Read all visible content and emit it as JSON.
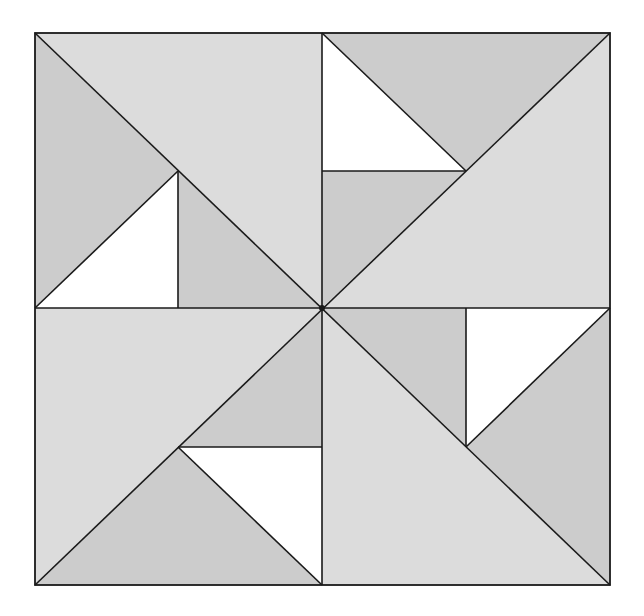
{
  "diagram": {
    "title": "",
    "colors": {
      "light": "#dcdcdc",
      "medium": "#cccccc",
      "white": "#ffffff",
      "stroke": "#1a1a1a",
      "background": "#ffffff"
    },
    "square": {
      "x0": 35,
      "y0": 33,
      "x1": 610,
      "y1": 585,
      "cx": 322,
      "cy": 308
    },
    "quadrants": [
      {
        "name": "top-left",
        "pieces": [
          {
            "id": "tl-large",
            "fill": "light",
            "points": "35,33 610,33 322,308",
            "note": "placeholder overwritten below"
          }
        ]
      }
    ],
    "pieces": [
      {
        "id": "tl-large",
        "quadrant": "top-left",
        "fill": "light",
        "points": "35,33 322,33 322,308"
      },
      {
        "id": "tl-left",
        "quadrant": "top-left",
        "fill": "medium",
        "points": "35,33 178,171 35,308"
      },
      {
        "id": "tl-white",
        "quadrant": "top-left",
        "fill": "white",
        "points": "35,308 178,171 178,308"
      },
      {
        "id": "tl-inner",
        "quadrant": "top-left",
        "fill": "medium",
        "points": "178,171 322,308 178,308"
      },
      {
        "id": "tr-large",
        "quadrant": "top-right",
        "fill": "light",
        "points": "610,33 610,308 322,308"
      },
      {
        "id": "tr-top",
        "quadrant": "top-right",
        "fill": "medium",
        "points": "322,33 610,33 466,171"
      },
      {
        "id": "tr-white",
        "quadrant": "top-right",
        "fill": "white",
        "points": "322,33 466,171 322,171"
      },
      {
        "id": "tr-inner",
        "quadrant": "top-right",
        "fill": "medium",
        "points": "322,171 466,171 322,308"
      },
      {
        "id": "bl-large",
        "quadrant": "bottom-left",
        "fill": "light",
        "points": "35,308 322,308 35,585"
      },
      {
        "id": "bl-inner",
        "quadrant": "bottom-left",
        "fill": "medium",
        "points": "322,308 322,447 178,447"
      },
      {
        "id": "bl-white",
        "quadrant": "bottom-left",
        "fill": "white",
        "points": "178,447 322,447 322,585"
      },
      {
        "id": "bl-bottom",
        "quadrant": "bottom-left",
        "fill": "medium",
        "points": "35,585 178,447 322,585"
      },
      {
        "id": "br-large",
        "quadrant": "bottom-right",
        "fill": "light",
        "points": "322,308 610,585 322,585"
      },
      {
        "id": "br-inner",
        "quadrant": "bottom-right",
        "fill": "medium",
        "points": "322,308 466,308 466,447"
      },
      {
        "id": "br-white",
        "quadrant": "bottom-right",
        "fill": "white",
        "points": "466,308 610,308 466,447"
      },
      {
        "id": "br-right",
        "quadrant": "bottom-right",
        "fill": "medium",
        "points": "610,308 610,585 466,447"
      }
    ],
    "lines": [
      {
        "id": "vertical-center",
        "x1": 322,
        "y1": 33,
        "x2": 322,
        "y2": 585
      },
      {
        "id": "horizontal-center",
        "x1": 35,
        "y1": 308,
        "x2": 610,
        "y2": 308
      },
      {
        "id": "diag-tl-br",
        "x1": 35,
        "y1": 33,
        "x2": 610,
        "y2": 585
      },
      {
        "id": "diag-tr-bl",
        "x1": 610,
        "y1": 33,
        "x2": 35,
        "y2": 585
      },
      {
        "id": "tl-white-diag",
        "x1": 35,
        "y1": 308,
        "x2": 178,
        "y2": 171
      },
      {
        "id": "tl-vertical",
        "x1": 178,
        "y1": 171,
        "x2": 178,
        "y2": 308
      },
      {
        "id": "tr-white-diag",
        "x1": 322,
        "y1": 33,
        "x2": 466,
        "y2": 171
      },
      {
        "id": "tr-horizontal",
        "x1": 322,
        "y1": 171,
        "x2": 466,
        "y2": 171
      },
      {
        "id": "bl-white-diag",
        "x1": 178,
        "y1": 447,
        "x2": 322,
        "y2": 585
      },
      {
        "id": "bl-horizontal",
        "x1": 178,
        "y1": 447,
        "x2": 322,
        "y2": 447
      },
      {
        "id": "br-white-diag",
        "x1": 466,
        "y1": 447,
        "x2": 610,
        "y2": 308
      },
      {
        "id": "br-vertical",
        "x1": 466,
        "y1": 308,
        "x2": 466,
        "y2": 447
      }
    ],
    "center_dot": {
      "cx": 322,
      "cy": 308,
      "r": 3
    }
  }
}
